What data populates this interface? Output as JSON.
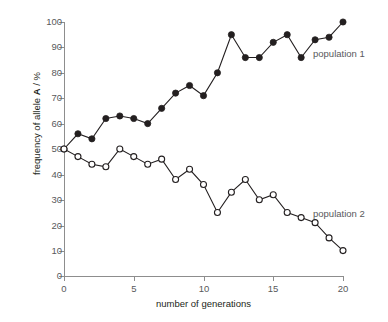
{
  "chart_data": {
    "type": "line",
    "title": "",
    "xlabel": "number of generations",
    "ylabel": "frequency of allele A / %",
    "ylabel_plain": "frequency of allele",
    "ylabel_bold": "A",
    "ylabel_unit": "/ %",
    "xlim": [
      0,
      20
    ],
    "ylim": [
      0,
      100
    ],
    "grid": false,
    "legend_position": "inline-annotation",
    "xticks": [
      0,
      5,
      10,
      15,
      20
    ],
    "yticks": [
      0,
      10,
      20,
      30,
      40,
      50,
      60,
      70,
      80,
      90,
      100
    ],
    "x": [
      0,
      1,
      2,
      3,
      4,
      5,
      6,
      7,
      8,
      9,
      10,
      11,
      12,
      13,
      14,
      15,
      16,
      17,
      18,
      19,
      20
    ],
    "series": [
      {
        "name": "population 1",
        "marker": "filled-circle",
        "color": "#231f20",
        "values": [
          50,
          56,
          54,
          62,
          63,
          62,
          60,
          66,
          72,
          75,
          71,
          80,
          95,
          86,
          86,
          92,
          95,
          86,
          93,
          94,
          100
        ]
      },
      {
        "name": "population 2",
        "marker": "open-circle",
        "color": "#231f20",
        "values": [
          50,
          47,
          44,
          43,
          50,
          47,
          44,
          46,
          38,
          42,
          36,
          25,
          33,
          38,
          30,
          32,
          25,
          23,
          21,
          15,
          10
        ]
      }
    ],
    "annotations": [
      {
        "text": "population 1",
        "x": 20,
        "y": 91
      },
      {
        "text": "population 2",
        "x": 20,
        "y": 26
      }
    ]
  },
  "axis": {
    "y_tick_labels": [
      "100",
      "90",
      "80",
      "70",
      "60",
      "50",
      "40",
      "30",
      "20",
      "10",
      "0"
    ],
    "x_tick_labels": [
      "0",
      "5",
      "10",
      "15",
      "20"
    ]
  }
}
